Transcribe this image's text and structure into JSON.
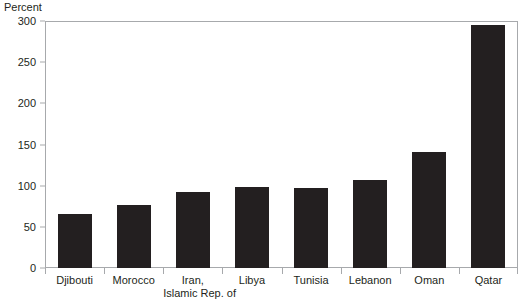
{
  "chart_data": {
    "type": "bar",
    "title": "",
    "subtitle": "",
    "xlabel": "",
    "ylabel": "Percent",
    "ylim": [
      0,
      300
    ],
    "ytick_values": [
      300,
      250,
      200,
      150,
      100,
      50,
      0
    ],
    "ytick_labels": [
      "300",
      "250",
      "200",
      "150",
      "100",
      "50",
      "0"
    ],
    "grid": false,
    "legend": null,
    "bar_color": "#231f20",
    "frame_color": "#a7a9ac",
    "categories": [
      "Djibouti",
      "Morocco",
      "Iran, Islamic Rep. of",
      "Libya",
      "Tunisia",
      "Lebanon",
      "Oman",
      "Qatar"
    ],
    "category_lines": [
      [
        "Djibouti",
        ""
      ],
      [
        "Morocco",
        ""
      ],
      [
        "Iran,",
        "Islamic Rep. of"
      ],
      [
        "Libya",
        ""
      ],
      [
        "Tunisia",
        ""
      ],
      [
        "Lebanon",
        ""
      ],
      [
        "Oman",
        ""
      ],
      [
        "Qatar",
        ""
      ]
    ],
    "values": [
      66,
      77,
      92,
      98,
      97,
      107,
      141,
      295
    ]
  }
}
